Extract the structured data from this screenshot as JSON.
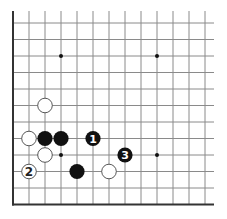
{
  "diagram": {
    "type": "go-board-diagram",
    "board_section": "lower-left corner (partial board)",
    "colors": {
      "background": "#ffffff",
      "grid_line": "#8a8a8a",
      "border_line": "#333333",
      "black_stone": "#111111",
      "white_stone_fill": "#ffffff",
      "white_stone_edge": "#444444"
    },
    "grid": {
      "columns": 13,
      "rows": 12,
      "x0": 13,
      "dx": 16,
      "y0": 23,
      "dy": 16.5,
      "line_extent_right": 214,
      "line_extent_top": 11,
      "left_border": true,
      "bottom_border": true
    },
    "star_points": [
      {
        "col": 3,
        "row": 2
      },
      {
        "col": 9,
        "row": 2
      },
      {
        "col": 3,
        "row": 8
      },
      {
        "col": 9,
        "row": 8
      }
    ],
    "stones": [
      {
        "color": "white",
        "col": 2,
        "row": 5,
        "label": ""
      },
      {
        "color": "white",
        "col": 1,
        "row": 7,
        "label": ""
      },
      {
        "color": "black",
        "col": 2,
        "row": 7,
        "label": ""
      },
      {
        "color": "black",
        "col": 3,
        "row": 7,
        "label": ""
      },
      {
        "color": "black",
        "col": 5,
        "row": 7,
        "label": "1"
      },
      {
        "color": "white",
        "col": 2,
        "row": 8,
        "label": ""
      },
      {
        "color": "black",
        "col": 7,
        "row": 8,
        "label": "3"
      },
      {
        "color": "white",
        "col": 1,
        "row": 9,
        "label": "2"
      },
      {
        "color": "black",
        "col": 4,
        "row": 9,
        "label": ""
      },
      {
        "color": "white",
        "col": 6,
        "row": 9,
        "label": ""
      }
    ],
    "move_labels": [
      "1",
      "2",
      "3"
    ]
  }
}
